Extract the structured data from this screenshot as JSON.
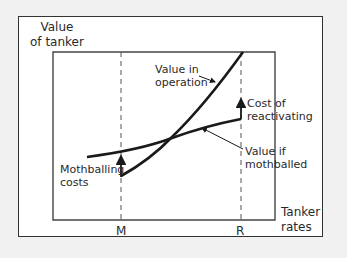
{
  "diagram": {
    "y_axis_label_line1": "Value",
    "y_axis_label_line2": "of tanker",
    "x_axis_label_line1": "Tanker",
    "x_axis_label_line2": "rates",
    "x_ticks": [
      "M",
      "R"
    ],
    "curves": [
      {
        "name": "Value in operation",
        "line1": "Value in",
        "line2": "operation",
        "style": "steep convex curve"
      },
      {
        "name": "Value if mothballed",
        "line1": "Value if",
        "line2": "mothballed",
        "style": "flatter curve"
      }
    ],
    "annotations": {
      "mothballing_line1": "Mothballing",
      "mothballing_line2": "costs",
      "reactivating_line1": "Cost of",
      "reactivating_line2": "reactivating"
    },
    "colors": {
      "background": "#f1f1f1",
      "panel": "#ffffff",
      "lines": "#1a1a1a",
      "dashed": "#555555"
    }
  }
}
